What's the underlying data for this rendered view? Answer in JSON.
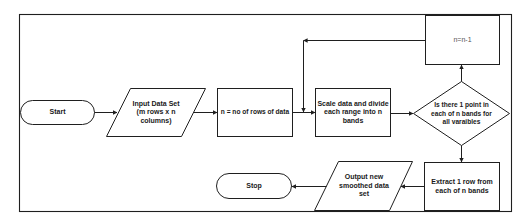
{
  "diagram": {
    "type": "flowchart",
    "colors": {
      "stroke": "#1f1f1f",
      "text": "#1a1a1a",
      "background": "#ffffff"
    },
    "nodes": {
      "start": {
        "shape": "terminator",
        "label": "Start"
      },
      "input": {
        "shape": "parallelogram",
        "label": "Input Data Set\n(m rows x n\ncolumns)"
      },
      "n_rows": {
        "shape": "process",
        "label": "n = no of rows of data"
      },
      "scale": {
        "shape": "process",
        "label": "Scale data and divide\neach range into n\nbands"
      },
      "decision": {
        "shape": "decision",
        "label": "Is there 1 point in\neach of n bands for\nall varaibles"
      },
      "decrement": {
        "shape": "process",
        "label": "n=n-1"
      },
      "extract": {
        "shape": "process",
        "label": "Extract 1 row from\neach of n bands"
      },
      "output": {
        "shape": "parallelogram",
        "label": "Output new\nsmoothed data\nset"
      },
      "stop": {
        "shape": "terminator",
        "label": "Stop"
      }
    },
    "edges": [
      {
        "from": "start",
        "to": "input"
      },
      {
        "from": "input",
        "to": "n_rows"
      },
      {
        "from": "n_rows",
        "to": "scale"
      },
      {
        "from": "scale",
        "to": "decision"
      },
      {
        "from": "decision",
        "to": "decrement",
        "direction": "up"
      },
      {
        "from": "decrement",
        "to": "scale",
        "direction": "loop-back"
      },
      {
        "from": "decision",
        "to": "extract",
        "direction": "down"
      },
      {
        "from": "extract",
        "to": "output"
      },
      {
        "from": "output",
        "to": "stop"
      }
    ]
  }
}
